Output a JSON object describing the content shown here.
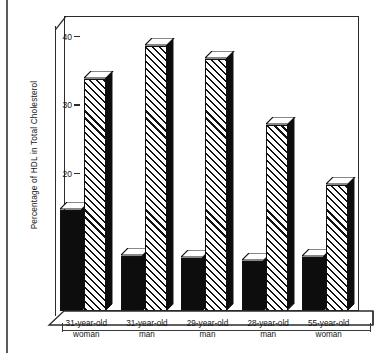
{
  "chart_data": {
    "type": "bar",
    "title": "",
    "subtitle": "",
    "xlabel": "",
    "ylabel": "Percentage of HDL in Total Cholesterol",
    "categories": [
      "31-year-old woman",
      "31-year-old man",
      "29-year-old man",
      "28-year-old man",
      "55-year-old woman"
    ],
    "category_lines": [
      [
        "31-year-old",
        "woman"
      ],
      [
        "31-year-old",
        "man"
      ],
      [
        "29-year-old",
        "man"
      ],
      [
        "28-year-old",
        "man"
      ],
      [
        "55-year-old",
        "woman"
      ]
    ],
    "series": [
      {
        "name": "solid-black-bar",
        "fill": "solid",
        "values": [
          15.3,
          8.3,
          8.0,
          7.6,
          8.2
        ]
      },
      {
        "name": "diagonal-hatched-bar",
        "fill": "diagonal-hatch",
        "values": [
          35.0,
          40.0,
          38.0,
          28.0,
          19.0
        ]
      }
    ],
    "ylim": [
      0,
      43
    ],
    "yticks": [
      0,
      10,
      20,
      30,
      40
    ],
    "ytick_labels": [
      "0",
      "10",
      "20",
      "30",
      "40"
    ],
    "grid": false,
    "legend": "none",
    "style": "3d-extruded-bars",
    "colors": {
      "bar_solid": "#0d0d0d",
      "bar_hatch_line": "#111111",
      "background": "#ffffff",
      "axis": "#2b2b2b",
      "text": "#161616"
    }
  }
}
